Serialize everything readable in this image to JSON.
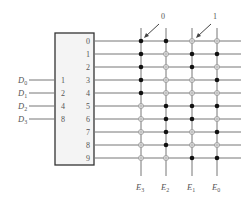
{
  "diagram": {
    "inputs": [
      {
        "label": "D",
        "sub": "0",
        "pin": "1"
      },
      {
        "label": "D",
        "sub": "1",
        "pin": "2"
      },
      {
        "label": "D",
        "sub": "2",
        "pin": "4"
      },
      {
        "label": "D",
        "sub": "3",
        "pin": "8"
      }
    ],
    "outputs_rows": [
      "0",
      "1",
      "2",
      "3",
      "4",
      "5",
      "6",
      "7",
      "8",
      "9"
    ],
    "columns": [
      {
        "label": "E",
        "sub": "3"
      },
      {
        "label": "E",
        "sub": "2"
      },
      {
        "label": "E",
        "sub": "1"
      },
      {
        "label": "E",
        "sub": "0"
      }
    ],
    "matrix": [
      [
        1,
        1,
        0,
        0
      ],
      [
        1,
        0,
        1,
        1
      ],
      [
        1,
        0,
        1,
        0
      ],
      [
        1,
        0,
        0,
        1
      ],
      [
        1,
        0,
        0,
        0
      ],
      [
        0,
        1,
        1,
        1
      ],
      [
        0,
        1,
        1,
        0
      ],
      [
        0,
        1,
        0,
        1
      ],
      [
        0,
        1,
        0,
        0
      ],
      [
        0,
        0,
        1,
        1
      ]
    ],
    "annotations": [
      {
        "text": "0",
        "points_to": "filled-dot"
      },
      {
        "text": "1",
        "points_to": "hollow-dot"
      }
    ],
    "colors": {
      "box_fill": "#f4f4f4",
      "box_stroke": "#333333",
      "line": "#777777",
      "filled_dot": "#111111",
      "hollow_dot": "#999999"
    }
  }
}
